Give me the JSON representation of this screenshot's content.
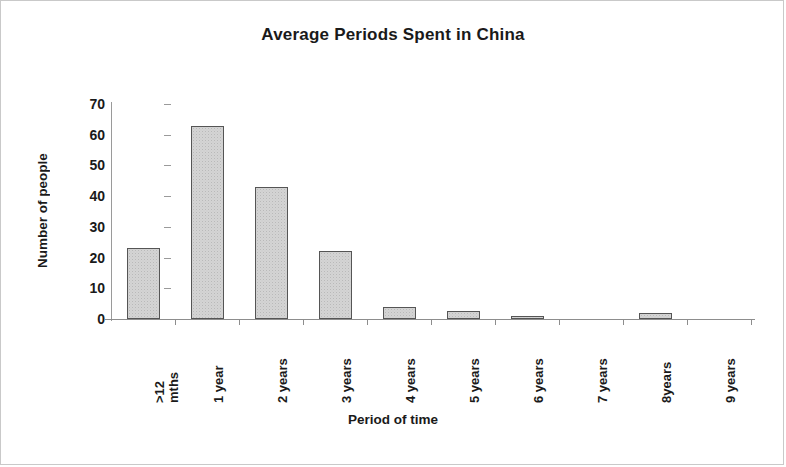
{
  "chart_data": {
    "type": "bar",
    "title": "Average Periods Spent in China",
    "xlabel": "Period of time",
    "ylabel": "Number of people",
    "categories": [
      ">12 mths",
      "1 year",
      "2 years",
      "3 years",
      "4 years",
      "5 years",
      "6 years",
      "7 years",
      "8years",
      "9 years"
    ],
    "category_lines": [
      [
        ">12",
        "mths"
      ],
      [
        "1 year"
      ],
      [
        "2 years"
      ],
      [
        "3 years"
      ],
      [
        "4 years"
      ],
      [
        "5 years"
      ],
      [
        "6 years"
      ],
      [
        "7 years"
      ],
      [
        "8years"
      ],
      [
        "9 years"
      ]
    ],
    "values": [
      23,
      63,
      43,
      22,
      4,
      2.5,
      1,
      0,
      2,
      0
    ],
    "ylim": [
      0,
      70
    ],
    "y_ticks": [
      0,
      10,
      20,
      30,
      40,
      50,
      60,
      70
    ],
    "grid": false,
    "legend": false,
    "bar_fill_color": "#d4d4d4",
    "bar_border_color": "#555555",
    "axis_color": "#8d8d8d",
    "text_color": "#1a1a1a",
    "frame_border_color": "#c9c9c9"
  }
}
